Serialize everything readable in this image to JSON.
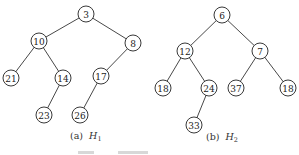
{
  "figures": [
    {
      "id": "H1",
      "caption_prefix": "(a)",
      "caption_label": "H",
      "caption_sub": "1",
      "caption_pos": [
        70,
        139
      ],
      "nodes": [
        {
          "id": "a3",
          "label": "3",
          "x": 86,
          "y": 14
        },
        {
          "id": "a10",
          "label": "10",
          "x": 39,
          "y": 41
        },
        {
          "id": "a8",
          "label": "8",
          "x": 133,
          "y": 43
        },
        {
          "id": "a21",
          "label": "21",
          "x": 11,
          "y": 78
        },
        {
          "id": "a14",
          "label": "14",
          "x": 63,
          "y": 78
        },
        {
          "id": "a17",
          "label": "17",
          "x": 101,
          "y": 76
        },
        {
          "id": "a23",
          "label": "23",
          "x": 44,
          "y": 115
        },
        {
          "id": "a26",
          "label": "26",
          "x": 80,
          "y": 115
        }
      ],
      "edges": [
        [
          "a3",
          "a10"
        ],
        [
          "a3",
          "a8"
        ],
        [
          "a10",
          "a21"
        ],
        [
          "a10",
          "a14"
        ],
        [
          "a14",
          "a23"
        ],
        [
          "a8",
          "a17"
        ],
        [
          "a17",
          "a26"
        ]
      ]
    },
    {
      "id": "H2",
      "caption_prefix": "(b)",
      "caption_label": "H",
      "caption_sub": "2",
      "caption_pos": [
        206,
        140
      ],
      "nodes": [
        {
          "id": "b6",
          "label": "6",
          "x": 222,
          "y": 15
        },
        {
          "id": "b12",
          "label": "12",
          "x": 185,
          "y": 51
        },
        {
          "id": "b7",
          "label": "7",
          "x": 260,
          "y": 51
        },
        {
          "id": "b18a",
          "label": "18",
          "x": 163,
          "y": 88
        },
        {
          "id": "b24",
          "label": "24",
          "x": 209,
          "y": 88
        },
        {
          "id": "b37",
          "label": "37",
          "x": 236,
          "y": 88
        },
        {
          "id": "b18b",
          "label": "18",
          "x": 288,
          "y": 88
        },
        {
          "id": "b33",
          "label": "33",
          "x": 194,
          "y": 125
        }
      ],
      "edges": [
        [
          "b6",
          "b12"
        ],
        [
          "b6",
          "b7"
        ],
        [
          "b12",
          "b18a"
        ],
        [
          "b12",
          "b24"
        ],
        [
          "b24",
          "b33"
        ],
        [
          "b7",
          "b37"
        ],
        [
          "b7",
          "b18b"
        ]
      ]
    }
  ],
  "node_radius": 8,
  "colors": {
    "stroke": "#222222",
    "text": "#222222",
    "background": "#ffffff"
  }
}
